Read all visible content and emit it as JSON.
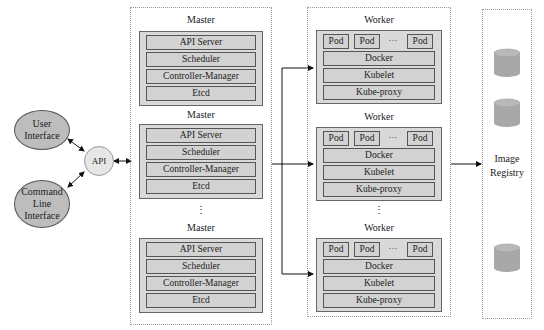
{
  "clients": {
    "user_interface": "User\nInterface",
    "cli": "Command\nLine\nInterface",
    "api": "API"
  },
  "masters": [
    {
      "title": "Master",
      "components": [
        "API Server",
        "Scheduler",
        "Controller-Manager",
        "Etcd"
      ]
    },
    {
      "title": "Master",
      "components": [
        "API Server",
        "Scheduler",
        "Controller-Manager",
        "Etcd"
      ]
    },
    {
      "title": "Master",
      "components": [
        "API Server",
        "Scheduler",
        "Controller-Manager",
        "Etcd"
      ]
    }
  ],
  "workers": [
    {
      "title": "Worker",
      "pods": [
        "Pod",
        "Pod",
        "Pod"
      ],
      "ellipsis": "···",
      "components": [
        "Docker",
        "Kubelet",
        "Kube-proxy"
      ]
    },
    {
      "title": "Worker",
      "pods": [
        "Pod",
        "Pod",
        "Pod"
      ],
      "ellipsis": "···",
      "components": [
        "Docker",
        "Kubelet",
        "Kube-proxy"
      ]
    },
    {
      "title": "Worker",
      "pods": [
        "Pod",
        "Pod",
        "Pod"
      ],
      "ellipsis": "···",
      "components": [
        "Docker",
        "Kubelet",
        "Kube-proxy"
      ]
    }
  ],
  "vertical_ellipsis": "⋮",
  "registry": {
    "label_line1": "Image",
    "label_line2": "Registry",
    "icons": [
      "database-icon",
      "database-icon",
      "database-icon"
    ]
  },
  "colors": {
    "component_fill": "#d2d2d2",
    "group_fill": "#d9d9d9",
    "ellipse_fill": "#bdbdbd",
    "api_fill": "#e6e6e6",
    "db_fill": "#a8a8a8"
  }
}
